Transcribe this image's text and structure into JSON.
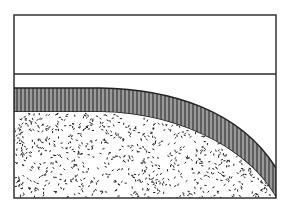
{
  "diagram": {
    "frame": {
      "x": 14,
      "y": 15,
      "width": 262,
      "height": 183,
      "stroke": "#333333"
    },
    "divider_line_y": 74,
    "band": {
      "fill": "#9a9a9a",
      "hatch_color": "#222222",
      "outer_top_y": 88,
      "inner_top_y": 112
    },
    "speckle": {
      "color": "#222222",
      "background": "#ffffff"
    },
    "colors": {
      "line": "#2a2a2a",
      "band_fill": "#9a9a9a",
      "background": "#ffffff"
    }
  }
}
